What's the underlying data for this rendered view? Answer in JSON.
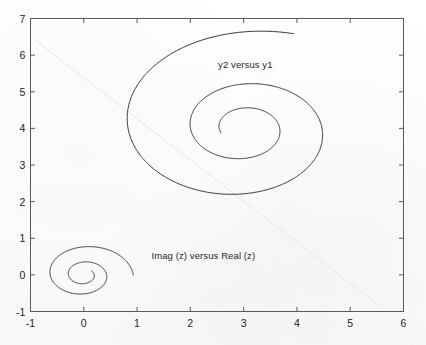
{
  "figure": {
    "background_color": "#fcfcfc",
    "axes_color": "#5a5a5a",
    "curve_color": "#2b2b2b",
    "text_color": "#1c1c1c",
    "crease_color": "#e2e2e2"
  },
  "chart_data": {
    "type": "line",
    "title": "",
    "xlabel": "",
    "ylabel": "",
    "xlim": [
      -1,
      6
    ],
    "ylim": [
      -1,
      7
    ],
    "xticks": [
      "-1",
      "0",
      "1",
      "2",
      "3",
      "4",
      "5",
      "6"
    ],
    "xtick_values": [
      -1,
      0,
      1,
      2,
      3,
      4,
      5,
      6
    ],
    "yticks": [
      "-1",
      "0",
      "1",
      "2",
      "3",
      "4",
      "5",
      "6",
      "7"
    ],
    "ytick_values": [
      -1,
      0,
      1,
      2,
      3,
      4,
      5,
      6,
      7
    ],
    "grid": false,
    "legend": "none",
    "annotations": [
      {
        "text": "y2 versus y1",
        "x": 2.52,
        "y": 5.72
      },
      {
        "text": "Imag (z) versus Real (z)",
        "x": 1.27,
        "y": 0.52
      }
    ],
    "series": [
      {
        "name": "Imag (z) versus Real (z)",
        "kind": "logarithmic-spiral",
        "center": [
          0.0,
          0.0
        ],
        "start_radius": 0.93,
        "decay_per_turn": 0.46,
        "start_angle_deg": 0,
        "turns": 2.1,
        "start_point": [
          1.0,
          0.0
        ],
        "end_point": [
          0.05,
          0.42
        ]
      },
      {
        "name": "y2 versus y1",
        "kind": "logarithmic-spiral",
        "center": [
          3.0,
          4.0
        ],
        "start_radius": 2.75,
        "decay_per_turn": 0.46,
        "start_angle_deg": 70,
        "turns": 2.35,
        "start_point": [
          3.82,
          6.55
        ],
        "end_point": [
          2.93,
          4.45
        ]
      }
    ]
  }
}
